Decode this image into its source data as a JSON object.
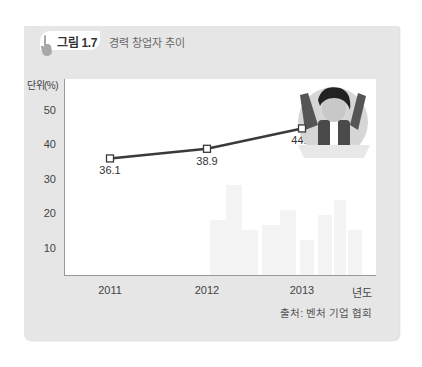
{
  "figure": {
    "number": "그림 1.7",
    "title": "경력 창업자 추이",
    "unit_label": "단위(%)",
    "source": "출처: 벤처 기업 협회",
    "hand_icon": "pointing-hand-icon",
    "illustration": "cheering-businessman-illustration"
  },
  "colors": {
    "panel_bg": "#e6e6e6",
    "plot_bg": "#ffffff",
    "line": "#3a3a3a",
    "marker_fill": "#ffffff"
  },
  "chart_data": {
    "type": "line",
    "title": "경력 창업자 추이",
    "xlabel": "년도",
    "ylabel": "단위(%)",
    "categories": [
      "2011",
      "2012",
      "2013"
    ],
    "series": [
      {
        "name": "경력 창업자 비율",
        "values": [
          36.1,
          38.9,
          44.8
        ]
      }
    ],
    "data_labels": [
      "36.1",
      "38.9",
      "44.8"
    ],
    "yticks": [
      10,
      20,
      30,
      40,
      50
    ],
    "ytick_labels": [
      "10",
      "20",
      "30",
      "40",
      "50"
    ],
    "ylim": [
      0,
      57
    ],
    "grid": false,
    "legend": "none",
    "source": "출처: 벤처 기업 협회"
  }
}
